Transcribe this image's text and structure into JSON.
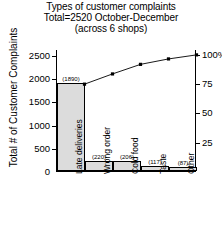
{
  "title": {
    "line1": "Types of customer complaints",
    "line2": "Total=2520 October-December",
    "line3": "(across 6 shops)"
  },
  "axes": {
    "ylabel": "Total # of Customer Complaints",
    "y_ticks": [
      "0",
      "500",
      "1000",
      "1500",
      "2000",
      "2500"
    ],
    "right_ticks": [
      "25",
      "50",
      "75",
      "100%"
    ]
  },
  "chart_data": {
    "type": "bar",
    "title": "Types of customer complaints Total=2520 October-December (across 6 shops)",
    "xlabel": "",
    "ylabel": "Total # of Customer Complaints",
    "ylim": [
      0,
      2625
    ],
    "grid": false,
    "legend": "none",
    "categories": [
      "Late deliveries",
      "Wrong order",
      "Cold food",
      "Taste",
      "Other"
    ],
    "values": [
      1890,
      220,
      206,
      117,
      87
    ],
    "value_labels": [
      "(1890)",
      "(220)",
      "(206)",
      "(117)",
      "(87)"
    ],
    "total": 2520,
    "series": [
      {
        "name": "Complaint count",
        "type": "bar",
        "values": [
          1890,
          220,
          206,
          117,
          87
        ]
      },
      {
        "name": "Cumulative percent",
        "type": "line",
        "axis": "right",
        "values": [
          1890,
          2110,
          2316,
          2433,
          2520
        ],
        "percents": [
          75.0,
          83.7,
          91.9,
          96.5,
          100.0
        ]
      }
    ],
    "right_axis": {
      "label": "",
      "ticks": [
        25,
        50,
        75,
        100
      ],
      "tick_labels": [
        "25",
        "50",
        "75",
        "100%"
      ],
      "lim": [
        0,
        104.2
      ]
    }
  }
}
